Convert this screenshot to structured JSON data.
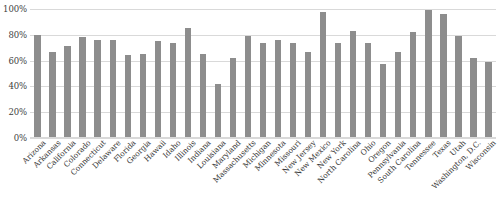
{
  "chart_data": {
    "type": "bar",
    "title": "",
    "subtitle": "",
    "xlabel": "",
    "ylabel": "",
    "ylim": [
      0,
      100
    ],
    "yticks": [
      "0%",
      "20%",
      "40%",
      "60%",
      "80%",
      "100%"
    ],
    "ytick_values": [
      0,
      20,
      40,
      60,
      80,
      100
    ],
    "grid": true,
    "legend": false,
    "legend_position": "none",
    "bar_color": "#8d8d8d",
    "gridline_color": "#d9d9d9",
    "categories": [
      "Arizona",
      "Arkansas",
      "California",
      "Colorado",
      "Connecticut",
      "Delaware",
      "Florida",
      "Georgia",
      "Hawaii",
      "Idaho",
      "Illinois",
      "Indiana",
      "Louisiana",
      "Maryland",
      "Massachusetts",
      "Michigan",
      "Minnesota",
      "Missouri",
      "New Jersey",
      "New Mexico",
      "New York",
      "North Carolina",
      "Ohio",
      "Oregon",
      "Pennsylvania",
      "South Carolina",
      "Tennessee",
      "Texas",
      "Utah",
      "Washington, D.C.",
      "Wisconsin"
    ],
    "values": [
      80,
      67,
      71,
      78,
      76,
      76,
      64,
      65,
      75,
      74,
      85,
      65,
      42,
      62,
      79,
      74,
      76,
      74,
      67,
      98,
      74,
      83,
      74,
      57,
      67,
      82,
      99,
      96,
      79,
      62,
      59
    ]
  }
}
